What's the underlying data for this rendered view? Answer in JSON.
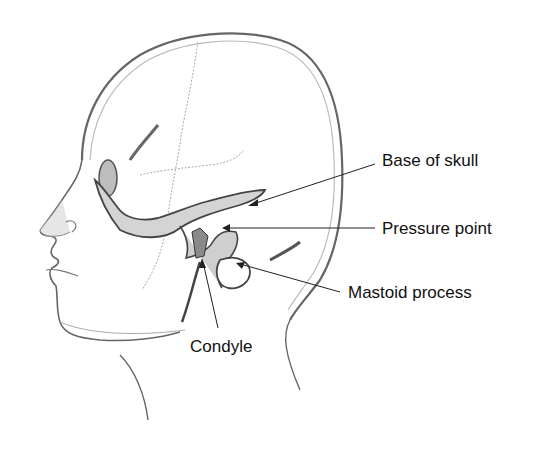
{
  "diagram": {
    "labels": [
      {
        "id": "base-of-skull",
        "text": "Base of skull",
        "x": 382,
        "y": 152
      },
      {
        "id": "pressure-point",
        "text": "Pressure point",
        "x": 382,
        "y": 220
      },
      {
        "id": "mastoid-process",
        "text": "Mastoid process",
        "x": 348,
        "y": 284
      },
      {
        "id": "condyle",
        "text": "Condyle",
        "x": 190,
        "y": 338
      }
    ],
    "colors": {
      "outline": "#555555",
      "bone_fill": "#d9d9d9",
      "bone_dark": "#4a4a4a",
      "suture": "#9a9a9a",
      "text": "#111111"
    }
  }
}
